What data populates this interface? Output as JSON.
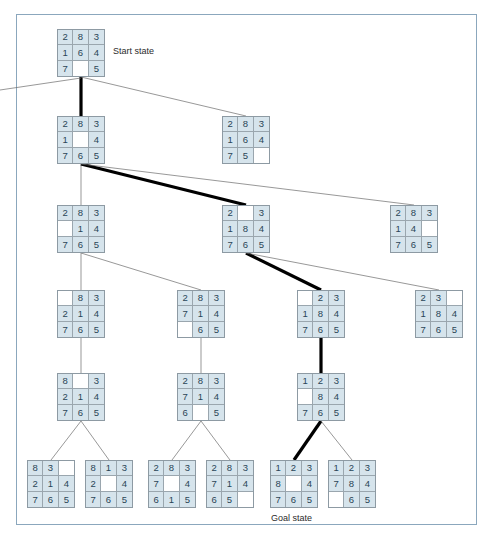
{
  "figure": {
    "frame_color": "#8ba7bd",
    "tile_fill": "#d6e4ec",
    "tile_text_color": "#2a4456",
    "blank_fill": "#ffffff",
    "edge_color": "#6b6b6b",
    "solution_path_color": "#000000"
  },
  "labels": {
    "start": "Start state",
    "goal": "Goal state"
  },
  "nodes": [
    {
      "id": "n0",
      "level": 0,
      "x": 57,
      "y": 29,
      "tiles": [
        "2",
        "8",
        "3",
        "1",
        "6",
        "4",
        "7",
        "",
        "5"
      ],
      "on_solution_path": true,
      "annotation": "Start state"
    },
    {
      "id": "n1",
      "level": 1,
      "x": 57,
      "y": 116,
      "tiles": [
        "2",
        "8",
        "3",
        "1",
        "",
        "4",
        "7",
        "6",
        "5"
      ],
      "on_solution_path": true,
      "annotation": ""
    },
    {
      "id": "n2",
      "level": 1,
      "x": 222,
      "y": 116,
      "tiles": [
        "2",
        "8",
        "3",
        "1",
        "6",
        "4",
        "7",
        "5",
        ""
      ],
      "on_solution_path": false,
      "annotation": ""
    },
    {
      "id": "n3",
      "level": 2,
      "x": 57,
      "y": 205,
      "tiles": [
        "2",
        "8",
        "3",
        "",
        "1",
        "4",
        "7",
        "6",
        "5"
      ],
      "on_solution_path": false,
      "annotation": ""
    },
    {
      "id": "n4",
      "level": 2,
      "x": 222,
      "y": 205,
      "tiles": [
        "2",
        "",
        "3",
        "1",
        "8",
        "4",
        "7",
        "6",
        "5"
      ],
      "on_solution_path": true,
      "annotation": ""
    },
    {
      "id": "n5",
      "level": 2,
      "x": 390,
      "y": 205,
      "tiles": [
        "2",
        "8",
        "3",
        "1",
        "4",
        "",
        "7",
        "6",
        "5"
      ],
      "on_solution_path": false,
      "annotation": ""
    },
    {
      "id": "n6",
      "level": 3,
      "x": 57,
      "y": 290,
      "tiles": [
        "",
        "8",
        "3",
        "2",
        "1",
        "4",
        "7",
        "6",
        "5"
      ],
      "on_solution_path": false,
      "annotation": ""
    },
    {
      "id": "n7",
      "level": 3,
      "x": 177,
      "y": 290,
      "tiles": [
        "2",
        "8",
        "3",
        "7",
        "1",
        "4",
        "",
        "6",
        "5"
      ],
      "on_solution_path": false,
      "annotation": ""
    },
    {
      "id": "n8",
      "level": 3,
      "x": 297,
      "y": 290,
      "tiles": [
        "",
        "2",
        "3",
        "1",
        "8",
        "4",
        "7",
        "6",
        "5"
      ],
      "on_solution_path": true,
      "annotation": ""
    },
    {
      "id": "n9",
      "level": 3,
      "x": 415,
      "y": 290,
      "tiles": [
        "2",
        "3",
        "",
        "1",
        "8",
        "4",
        "7",
        "6",
        "5"
      ],
      "on_solution_path": false,
      "annotation": ""
    },
    {
      "id": "n10",
      "level": 4,
      "x": 57,
      "y": 373,
      "tiles": [
        "8",
        "",
        "3",
        "2",
        "1",
        "4",
        "7",
        "6",
        "5"
      ],
      "on_solution_path": false,
      "annotation": ""
    },
    {
      "id": "n11",
      "level": 4,
      "x": 177,
      "y": 373,
      "tiles": [
        "2",
        "8",
        "3",
        "7",
        "1",
        "4",
        "6",
        "",
        "5"
      ],
      "on_solution_path": false,
      "annotation": ""
    },
    {
      "id": "n12",
      "level": 4,
      "x": 297,
      "y": 373,
      "tiles": [
        "1",
        "2",
        "3",
        "",
        "8",
        "4",
        "7",
        "6",
        "5"
      ],
      "on_solution_path": true,
      "annotation": ""
    },
    {
      "id": "n13",
      "level": 5,
      "x": 27,
      "y": 460,
      "tiles": [
        "8",
        "3",
        "",
        "2",
        "1",
        "4",
        "7",
        "6",
        "5"
      ],
      "on_solution_path": false,
      "annotation": ""
    },
    {
      "id": "n14",
      "level": 5,
      "x": 85,
      "y": 460,
      "tiles": [
        "8",
        "1",
        "3",
        "2",
        "",
        "4",
        "7",
        "6",
        "5"
      ],
      "on_solution_path": false,
      "annotation": ""
    },
    {
      "id": "n15",
      "level": 5,
      "x": 148,
      "y": 460,
      "tiles": [
        "2",
        "8",
        "3",
        "7",
        "",
        "4",
        "6",
        "1",
        "5"
      ],
      "on_solution_path": false,
      "annotation": ""
    },
    {
      "id": "n16",
      "level": 5,
      "x": 206,
      "y": 460,
      "tiles": [
        "2",
        "8",
        "3",
        "7",
        "1",
        "4",
        "6",
        "5",
        ""
      ],
      "on_solution_path": false,
      "annotation": ""
    },
    {
      "id": "n17",
      "level": 5,
      "x": 270,
      "y": 460,
      "tiles": [
        "1",
        "2",
        "3",
        "8",
        "",
        "4",
        "7",
        "6",
        "5"
      ],
      "on_solution_path": true,
      "annotation": "Goal state"
    },
    {
      "id": "n18",
      "level": 5,
      "x": 328,
      "y": 460,
      "tiles": [
        "1",
        "2",
        "3",
        "7",
        "8",
        "4",
        "",
        "6",
        "5"
      ],
      "on_solution_path": false,
      "annotation": ""
    }
  ],
  "edges": [
    {
      "from": "n0",
      "to": "n1",
      "thick": true
    },
    {
      "from": "n0",
      "to": "n2",
      "thick": false
    },
    {
      "from": "n1",
      "to": "n3",
      "thick": false
    },
    {
      "from": "n1",
      "to": "n4",
      "thick": true
    },
    {
      "from": "n1",
      "to": "n5",
      "thick": false
    },
    {
      "from": "n3",
      "to": "n6",
      "thick": false
    },
    {
      "from": "n3",
      "to": "n7",
      "thick": false
    },
    {
      "from": "n4",
      "to": "n8",
      "thick": true
    },
    {
      "from": "n4",
      "to": "n9",
      "thick": false
    },
    {
      "from": "n6",
      "to": "n10",
      "thick": false
    },
    {
      "from": "n7",
      "to": "n11",
      "thick": false
    },
    {
      "from": "n8",
      "to": "n12",
      "thick": true
    },
    {
      "from": "n10",
      "to": "n13",
      "thick": false
    },
    {
      "from": "n10",
      "to": "n14",
      "thick": false
    },
    {
      "from": "n11",
      "to": "n15",
      "thick": false
    },
    {
      "from": "n11",
      "to": "n16",
      "thick": false
    },
    {
      "from": "n12",
      "to": "n17",
      "thick": true
    },
    {
      "from": "n12",
      "to": "n18",
      "thick": false
    }
  ],
  "stray_edges": [
    {
      "from_x": 81,
      "from_y": 78,
      "to_x": 0,
      "to_y": 90
    }
  ]
}
